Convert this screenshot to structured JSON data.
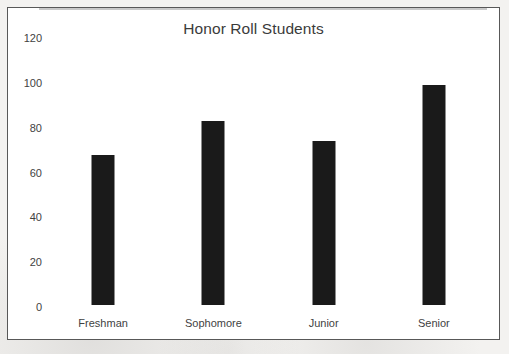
{
  "chart_data": {
    "type": "bar",
    "title": "Honor Roll Students",
    "xlabel": "",
    "ylabel": "",
    "categories": [
      "Freshman",
      "Sophomore",
      "Junior",
      "Senior"
    ],
    "values": [
      67,
      82,
      73,
      98
    ],
    "ylim": [
      0,
      120
    ],
    "yticks": [
      "0",
      "20",
      "40",
      "60",
      "80",
      "100",
      "120"
    ],
    "ytick_values": [
      0,
      20,
      40,
      60,
      80,
      100,
      120
    ],
    "grid": false,
    "legend": null,
    "bar_color": "#1a1a1a",
    "axis_color": "#c9c9c9",
    "frame_color": "#585858",
    "plot_background": "#ffffff",
    "page_background": "#f3f2f0",
    "text_color": "#3f3f3f",
    "title_color": "#3b3b3b"
  }
}
